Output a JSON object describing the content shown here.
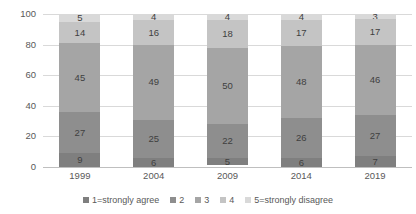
{
  "chart_data": {
    "type": "bar",
    "subtype": "stacked-column-100",
    "title": "",
    "xlabel": "",
    "ylabel": "",
    "ylim": [
      0,
      100
    ],
    "yticks": [
      "0",
      "20",
      "40",
      "60",
      "80",
      "100"
    ],
    "grid": true,
    "legend_position": "bottom",
    "categories": [
      "1999",
      "2004",
      "2009",
      "2014",
      "2019"
    ],
    "series": [
      {
        "name": "1=strongly agree",
        "color": "#7f7f7f",
        "values": [
          9,
          6,
          5,
          6,
          7
        ]
      },
      {
        "name": "2",
        "color": "#8e8e8e",
        "values": [
          27,
          25,
          22,
          26,
          27
        ]
      },
      {
        "name": "3",
        "color": "#a5a5a5",
        "values": [
          45,
          49,
          50,
          48,
          46
        ]
      },
      {
        "name": "4",
        "color": "#c4c4c4",
        "values": [
          14,
          16,
          18,
          17,
          17
        ]
      },
      {
        "name": "5=strongly disagree",
        "color": "#d9d9d9",
        "values": [
          5,
          4,
          4,
          4,
          3
        ]
      }
    ]
  }
}
